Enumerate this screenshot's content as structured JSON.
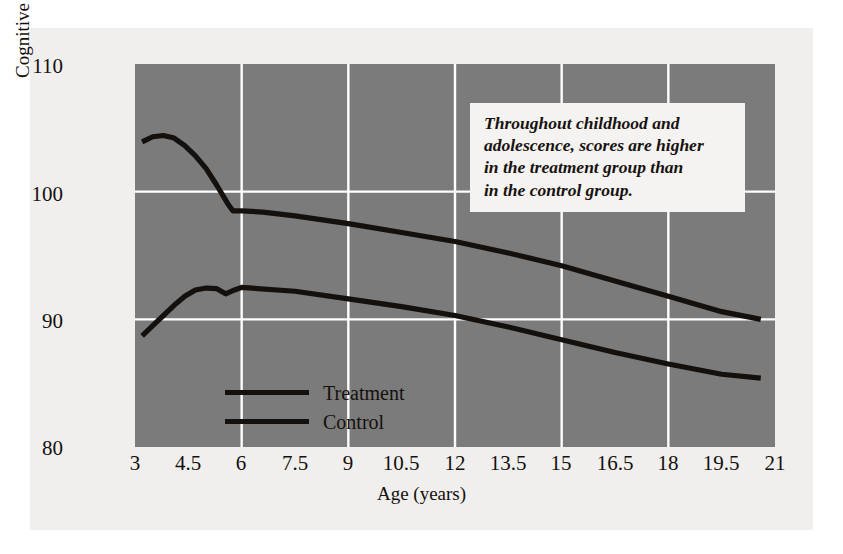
{
  "figure": {
    "background_color": "#f0efed",
    "plot_background_color": "#7b7b7b",
    "grid_color": "#ffffff",
    "line_color": "#14100d"
  },
  "annotation": {
    "line1": "Throughout childhood and",
    "line2": "adolescence, scores are higher",
    "line3": "in the treatment group than",
    "line4": "in the control group."
  },
  "legend": {
    "items": [
      {
        "label": "Treatment",
        "color": "#14100d"
      },
      {
        "label": "Control",
        "color": "#14100d"
      }
    ]
  },
  "chart_data": {
    "type": "line",
    "title": "",
    "xlabel": "Age (years)",
    "ylabel": "Cognitive score",
    "xlim": [
      3,
      21
    ],
    "ylim": [
      80,
      110
    ],
    "xticks": [
      3,
      4.5,
      6,
      7.5,
      9,
      10.5,
      12,
      13.5,
      15,
      16.5,
      18,
      19.5,
      21
    ],
    "xticklabels": [
      "3",
      "4.5",
      "6",
      "7.5",
      "9",
      "10.5",
      "12",
      "13.5",
      "15",
      "16.5",
      "18",
      "19.5",
      "21"
    ],
    "yticks": [
      80,
      90,
      100,
      110
    ],
    "yticklabels": [
      "80",
      "90",
      "100",
      "110"
    ],
    "x_gridlines": [
      6,
      9,
      12,
      15,
      18
    ],
    "y_gridlines": [
      90,
      100
    ],
    "grid": true,
    "legend_position": "inside-lower-left",
    "series": [
      {
        "name": "Treatment",
        "color": "#14100d",
        "points": [
          [
            3.2,
            103.9
          ],
          [
            3.5,
            104.3
          ],
          [
            3.8,
            104.4
          ],
          [
            4.1,
            104.2
          ],
          [
            4.4,
            103.6
          ],
          [
            4.7,
            102.8
          ],
          [
            5.0,
            101.8
          ],
          [
            5.3,
            100.5
          ],
          [
            5.6,
            99.1
          ],
          [
            5.75,
            98.5
          ],
          [
            6.0,
            98.5
          ],
          [
            6.6,
            98.4
          ],
          [
            7.5,
            98.1
          ],
          [
            9.0,
            97.5
          ],
          [
            10.5,
            96.8
          ],
          [
            12.0,
            96.1
          ],
          [
            13.5,
            95.2
          ],
          [
            15.0,
            94.2
          ],
          [
            16.5,
            93.0
          ],
          [
            18.0,
            91.8
          ],
          [
            19.5,
            90.6
          ],
          [
            20.6,
            90.0
          ]
        ]
      },
      {
        "name": "Control",
        "color": "#14100d",
        "points": [
          [
            3.2,
            88.7
          ],
          [
            3.5,
            89.5
          ],
          [
            3.8,
            90.3
          ],
          [
            4.1,
            91.1
          ],
          [
            4.4,
            91.8
          ],
          [
            4.7,
            92.3
          ],
          [
            5.0,
            92.45
          ],
          [
            5.3,
            92.4
          ],
          [
            5.55,
            92.0
          ],
          [
            5.8,
            92.3
          ],
          [
            6.0,
            92.5
          ],
          [
            7.5,
            92.2
          ],
          [
            9.0,
            91.6
          ],
          [
            10.5,
            91.0
          ],
          [
            12.0,
            90.3
          ],
          [
            13.5,
            89.4
          ],
          [
            15.0,
            88.4
          ],
          [
            16.5,
            87.4
          ],
          [
            18.0,
            86.5
          ],
          [
            19.5,
            85.7
          ],
          [
            20.6,
            85.4
          ]
        ]
      }
    ]
  }
}
